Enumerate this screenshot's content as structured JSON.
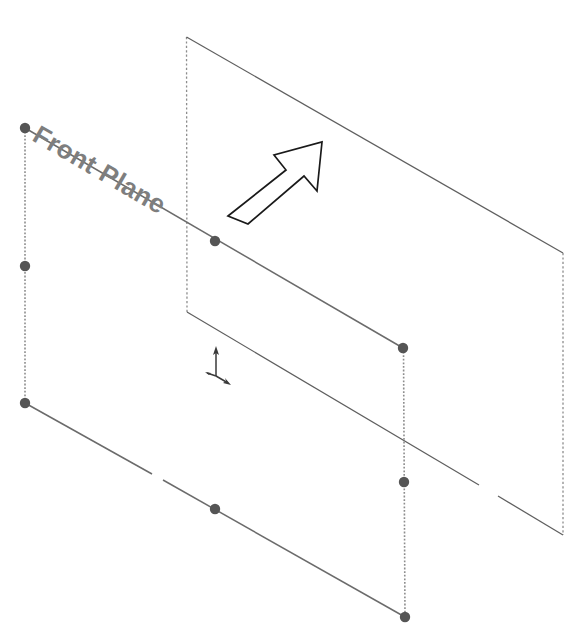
{
  "viewport": {
    "width": 568,
    "height": 629,
    "background_color": "#ffffff"
  },
  "labels": {
    "front_plane": "Front Plane"
  },
  "colors": {
    "plane_edge_solid": "#6b6b6b",
    "plane_edge_dashed": "#8d8d8d",
    "reference_plane_edge": "#5f5f5f",
    "vertex_dot": "#555555",
    "arrow_outline": "#1a1a1a",
    "label_text": "#7e7e7e",
    "triad_axis": "#3a3a3a"
  },
  "geometry": {
    "front_plane": {
      "name": "Front Plane",
      "style": "selected-reference-plane",
      "corners": [
        {
          "name": "top-left",
          "x": 25,
          "y": 128
        },
        {
          "name": "top-right",
          "x": 403,
          "y": 348
        },
        {
          "name": "bottom-right",
          "x": 405,
          "y": 617
        },
        {
          "name": "bottom-left",
          "x": 25,
          "y": 403
        }
      ],
      "midpoint_handles": [
        {
          "name": "left-edge-midpoint",
          "x": 25,
          "y": 266
        },
        {
          "name": "top-edge-midpoint",
          "x": 215,
          "y": 241
        },
        {
          "name": "right-edge-midpoint",
          "x": 404,
          "y": 482
        },
        {
          "name": "bottom-edge-midpoint",
          "x": 215,
          "y": 509
        }
      ],
      "edge_styles": {
        "top": "solid",
        "right": "dashed",
        "bottom": "solid",
        "left": "dashed"
      }
    },
    "background_plane": {
      "name": "Background Reference Plane",
      "style": "reference-plane",
      "corners": [
        {
          "name": "top-left",
          "x": 186,
          "y": 37
        },
        {
          "name": "top-right",
          "x": 563,
          "y": 253
        },
        {
          "name": "bottom-right",
          "x": 563,
          "y": 535
        },
        {
          "name": "bottom-left",
          "x": 187,
          "y": 312
        }
      ],
      "edge_styles": {
        "top": "solid",
        "right": "dashed",
        "bottom": "solid",
        "left": "dashed"
      }
    },
    "extrusion_arrow": {
      "name": "Direction Arrow",
      "direction": "up-right",
      "angle_degrees": 40,
      "filled": false,
      "tip": {
        "x": 322,
        "y": 142
      },
      "tail": {
        "x": 230,
        "y": 222
      }
    },
    "origin_triad": {
      "name": "Coordinate Origin Triad",
      "origin": {
        "x": 216,
        "y": 376
      },
      "axes": [
        {
          "name": "y-axis",
          "direction": "up"
        },
        {
          "name": "x-axis",
          "direction": "down-right"
        },
        {
          "name": "z-axis",
          "direction": "left"
        }
      ]
    }
  }
}
